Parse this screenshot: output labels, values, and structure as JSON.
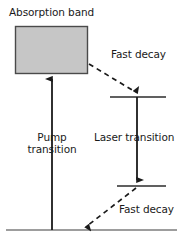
{
  "figure": {
    "kind": "energy-level-diagram",
    "title_visible": false,
    "width": 183,
    "height": 246,
    "background_color": "#ffffff",
    "line_color": "#1a1a1a",
    "band_fill_color": "#c6c6c6",
    "band_stroke_color": "#4a4a4a"
  },
  "labels": {
    "absorption_band": "Absorption band",
    "fast_decay_upper": "Fast decay",
    "pump_transition_line1": "Pump",
    "pump_transition_line2": "transition",
    "laser_transition": "Laser transition",
    "fast_decay_lower": "Fast decay"
  },
  "levels": {
    "absorption_band": {
      "name": "Absorption band",
      "type": "filled-rect",
      "x1": 15,
      "y1": 26,
      "x2": 88,
      "y2": 74
    },
    "upper_laser_level": {
      "name": "Upper laser level",
      "type": "horizontal-line",
      "x1": 110,
      "y1": 97,
      "x2": 166
    },
    "lower_laser_level": {
      "name": "Lower laser level",
      "type": "horizontal-line",
      "x1": 117,
      "y1": 186,
      "x2": 166
    },
    "ground_level": {
      "name": "Ground level",
      "type": "horizontal-line",
      "x1": 6,
      "y1": 230,
      "x2": 177
    }
  },
  "transitions": [
    {
      "name": "pump-transition",
      "style": "solid",
      "direction": "up",
      "label": "Pump transition",
      "from_x": 52,
      "from_y": 230,
      "to_x": 52,
      "to_y": 72
    },
    {
      "name": "fast-decay-upper",
      "style": "dashed",
      "direction": "down-right",
      "label": "Fast decay",
      "from_x": 89,
      "from_y": 67,
      "to_x": 137,
      "to_y": 95
    },
    {
      "name": "laser-transition",
      "style": "solid",
      "direction": "down",
      "label": "Laser transition",
      "from_x": 137,
      "from_y": 97,
      "to_x": 137,
      "to_y": 186
    },
    {
      "name": "fast-decay-lower",
      "style": "dashed",
      "direction": "down-left",
      "label": "Fast decay",
      "from_x": 136,
      "from_y": 188,
      "to_x": 84,
      "to_y": 229
    }
  ]
}
